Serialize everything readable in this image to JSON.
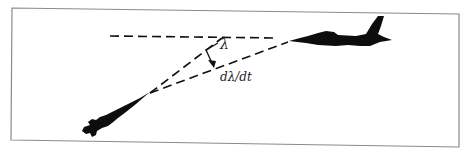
{
  "diagram": {
    "type": "missile-target geometry / proportional navigation",
    "labels": {
      "angle": "λ",
      "rate": "dλ/dt"
    },
    "elements": {
      "frame": "rectangular border",
      "reference_line": "horizontal dashed reference line",
      "line_of_sight": "dashed line of sight from missile to aircraft",
      "line_of_sight_later": "dashed line of sight (rotated)",
      "angle_arrow": "curved arrow indicating λ",
      "missile": "missile silhouette (lower left)",
      "aircraft": "fighter jet silhouette (upper right)"
    },
    "colors": {
      "ink": "#111111",
      "frame": "#8a8a8a",
      "background": "#ffffff"
    }
  }
}
